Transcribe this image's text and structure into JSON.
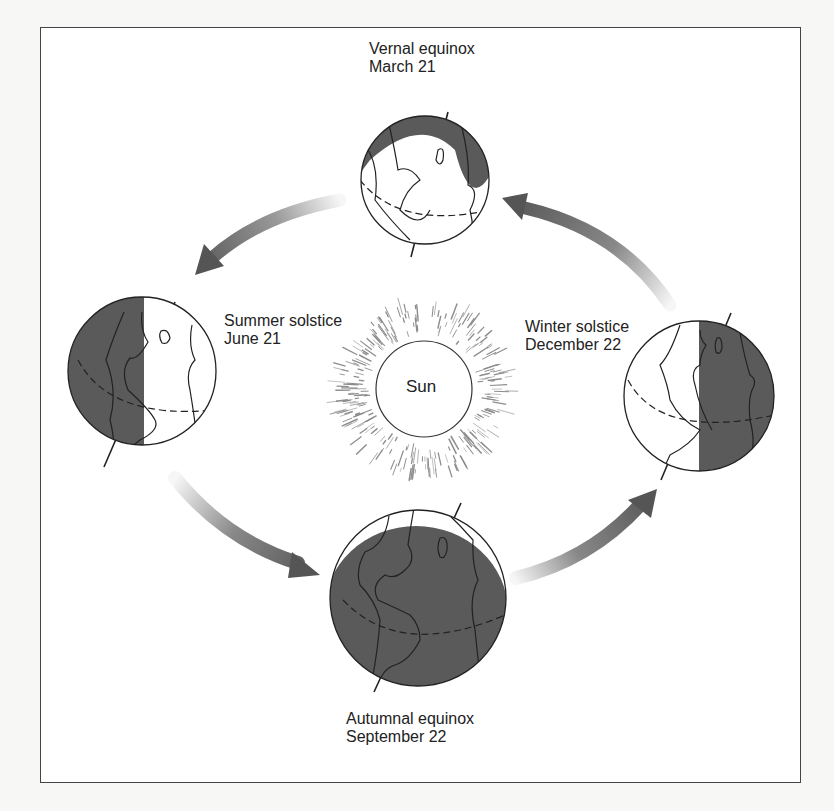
{
  "diagram": {
    "type": "seasons-orbit",
    "center_label": "Sun",
    "positions": [
      {
        "id": "vernal",
        "name": "Vernal equinox",
        "date": "March 21",
        "shading": "top-crescent"
      },
      {
        "id": "summer",
        "name": "Summer solstice",
        "date": "June 21",
        "shading": "left-half"
      },
      {
        "id": "winter",
        "name": "Winter solstice",
        "date": "December 22",
        "shading": "right-half"
      },
      {
        "id": "autumnal",
        "name": "Autumnal equinox",
        "date": "September 22",
        "shading": "mostly-dark"
      }
    ],
    "arrows": [
      {
        "from": "vernal",
        "to": "summer",
        "direction": "counterclockwise"
      },
      {
        "from": "summer",
        "to": "autumnal",
        "direction": "counterclockwise"
      },
      {
        "from": "autumnal",
        "to": "winter",
        "direction": "counterclockwise"
      },
      {
        "from": "winter",
        "to": "vernal",
        "direction": "counterclockwise"
      }
    ],
    "colors": {
      "shadow": "#5a5a5a",
      "outline": "#222222",
      "arrow": "#555555",
      "background": "#ffffff"
    }
  }
}
